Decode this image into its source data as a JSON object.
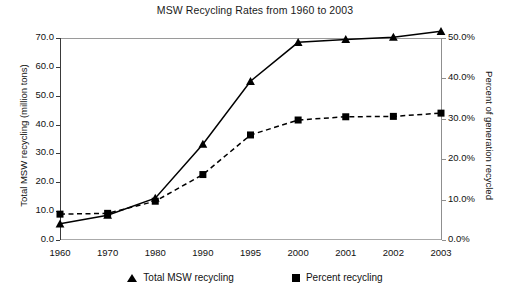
{
  "chart_data": {
    "type": "line",
    "title": "MSW Recycling Rates from 1960 to 2003",
    "xlabel": "",
    "ylabel": "Total MSW recycling (million tons)",
    "y2label": "Percent of generation recycled",
    "categories": [
      "1960",
      "1970",
      "1980",
      "1990",
      "1995",
      "2000",
      "2001",
      "2002",
      "2003"
    ],
    "ylim": [
      0,
      70
    ],
    "y2lim": [
      0,
      50
    ],
    "yticks": [
      "0.0",
      "10.0",
      "20.0",
      "30.0",
      "40.0",
      "50.0",
      "60.0",
      "70.0"
    ],
    "y2ticks": [
      "0.0%",
      "10.0%",
      "20.0%",
      "30.0%",
      "40.0%",
      "50.0%"
    ],
    "grid": false,
    "legend_position": "bottom",
    "series": [
      {
        "name": "Total MSW recycling",
        "axis": "left",
        "marker": "triangle",
        "linestyle": "solid",
        "color": "#000000",
        "units": "million tons",
        "values": [
          5.6,
          8.6,
          14.5,
          33.2,
          55.0,
          68.5,
          69.5,
          70.3,
          72.3
        ]
      },
      {
        "name": "Percent recycling",
        "axis": "right",
        "marker": "square",
        "linestyle": "dashed",
        "color": "#000000",
        "units": "percent",
        "values": [
          6.4,
          6.6,
          9.6,
          16.2,
          26.0,
          29.7,
          30.5,
          30.6,
          31.4
        ]
      }
    ]
  },
  "legend": {
    "items": [
      {
        "label": "Total MSW recycling",
        "marker": "triangle-marker"
      },
      {
        "label": "Percent recycling",
        "marker": "square-marker"
      }
    ]
  }
}
